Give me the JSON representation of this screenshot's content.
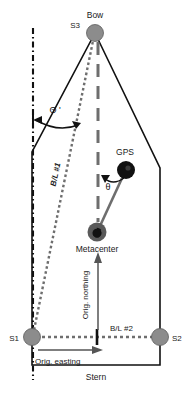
{
  "figure": {
    "type": "vessel-geometry-diagram",
    "background_color": "#ffffff",
    "line_color": "#111111",
    "node_color": "#8c8c8c",
    "gps_color": "#111111",
    "baseline_color": "#7a7a7a"
  },
  "labels": {
    "bow": "Bow",
    "stern": "Stern",
    "s3": "S3",
    "s1": "S1",
    "s2": "S2",
    "gps": "GPS",
    "metacenter": "Metacenter",
    "baseline_1": "B/L #1",
    "baseline_2": "B/L #2",
    "theta_prime": "Θ '",
    "theta": "θ",
    "orig_northing": "Orig. northing",
    "orig_easting": "Orig. easting"
  },
  "nodes": [
    {
      "name": "S3",
      "role": "bow-antenna",
      "x": 95,
      "y": 33,
      "r": 8.5,
      "fill": "#8c8c8c"
    },
    {
      "name": "S1",
      "role": "port-stern-antenna",
      "x": 32,
      "y": 337,
      "r": 8.5,
      "fill": "#8c8c8c"
    },
    {
      "name": "S2",
      "role": "starboard-stern-antenna",
      "x": 160,
      "y": 337,
      "r": 8.5,
      "fill": "#8c8c8c"
    },
    {
      "name": "GPS",
      "role": "gps-receiver",
      "x": 126,
      "y": 170,
      "r": 8.5,
      "fill": "#111111"
    },
    {
      "name": "Metacenter",
      "role": "metacenter-point",
      "x": 97,
      "y": 232,
      "r": 9,
      "fill": "#4a4a4a"
    }
  ],
  "hull_outline": {
    "description": "vessel plan view outline",
    "points": "95,33 160,168 160,365 32,365 32,152 95,33"
  },
  "lines": {
    "reference_vertical": {
      "style": "dash-dot",
      "x": 33,
      "y1": 28,
      "y2": 380
    },
    "baseline_1": {
      "style": "dotted",
      "from": "S1",
      "to": "S3",
      "label": "B/L #1"
    },
    "baseline_2": {
      "style": "dotted",
      "from": "S1",
      "to": "S2",
      "label": "B/L #2"
    },
    "centerline": {
      "style": "long-dash",
      "x": 98,
      "y1": 40,
      "y2": 225
    },
    "gps_to_metacenter": {
      "style": "solid-thick",
      "from": "GPS",
      "to": "Metacenter"
    },
    "northing_arrow": {
      "direction": "up",
      "x": 98,
      "y1": 330,
      "y2": 255
    },
    "easting_arrow": {
      "direction": "right",
      "y": 350,
      "x1": 36,
      "x2": 100
    }
  },
  "angles": [
    {
      "name": "theta-prime",
      "symbol": "Θ '",
      "vertex_x": 72,
      "vertex_y": 118,
      "between": [
        "reference_vertical",
        "baseline_1"
      ]
    },
    {
      "name": "theta",
      "symbol": "θ",
      "vertex_x": 118,
      "vertex_y": 180,
      "between": [
        "centerline",
        "gps_to_metacenter"
      ]
    }
  ]
}
